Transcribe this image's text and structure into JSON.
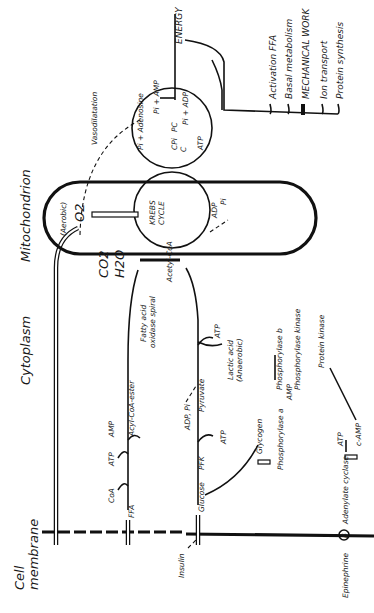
{
  "diagram": {
    "regions": {
      "cell_membrane": "Cell membrane",
      "cell_membrane_line1": "Cell",
      "cell_membrane_line2": "membrane",
      "cytoplasm": "Cytoplasm",
      "mitochondrion": "Mitochondrion"
    },
    "outputs": {
      "energy": "ENERGY",
      "items": [
        "Activation FFA",
        "Basal metabolism",
        "MECHANICAL WORK",
        "Ion transport",
        "Protein synthesis"
      ]
    },
    "mitochondrion": {
      "aerobic": "(Aerobic)",
      "o2": "O2",
      "krebs_line1": "KREBS",
      "krebs_line2": "CYCLE",
      "co2": "CO2",
      "h2o": "H2O",
      "acetyl_coa": "Acetyl-CoA",
      "adp": "ADP",
      "pi": "Pi"
    },
    "energy_cycle": {
      "pi_adenosine": "Pi + Adenosine",
      "pi_amp": "Pi + AMP",
      "pi_adp": "Pi + ADP",
      "cpi": "CPi",
      "pc": "PC",
      "c": "C",
      "atp": "ATP",
      "vasodilatation": "Vasodilatation"
    },
    "fatty_acid_path": {
      "ffa": "FFA",
      "coa": "CoA",
      "atp": "ATP",
      "amp": "AMP",
      "acyl_coa_ester": "Acyl-CoA-ester",
      "spiral_line1": "Fatty acid",
      "spiral_line2": "oxidase spiral"
    },
    "glycolysis_path": {
      "insulin": "Insulin",
      "glucose": "Glucose",
      "pfk": "PFK",
      "adp_pi": "ADP, Pi",
      "atp": "ATP",
      "pyruvate": "Pyruvate",
      "atp2": "ATP",
      "lactic_line1": "Lactic acid",
      "lactic_line2": "(Anaerobic)",
      "glycogen": "Glycogen"
    },
    "signaling": {
      "epinephrine": "Epinephrine",
      "beta": "β",
      "adenylate_cyclase": "Adenylate cyclase",
      "atp": "ATP",
      "camp": "c-AMP",
      "protein_kinase": "Protein kinase",
      "phosphorylase_kinase": "Phosphorylase kinase",
      "phosphorylase_b": "Phosphorylase b",
      "phosphorylase_a": "Phosphorylase a",
      "amp": "AMP"
    },
    "colors": {
      "ink": "#111111",
      "paper": "#ffffff"
    }
  }
}
